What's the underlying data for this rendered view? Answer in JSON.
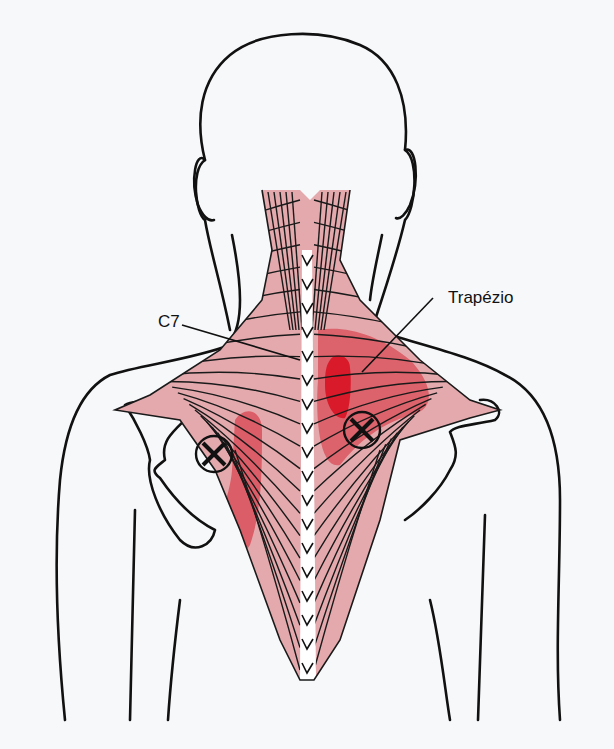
{
  "figure": {
    "labels": {
      "c7": "C7",
      "trapezius": "Trapézio"
    },
    "colors": {
      "background": "#f7f8fa",
      "muscle": "#e3a9ad",
      "muscle_dark": "#d88890",
      "referred_pain": "#d9505a",
      "referred_pain_intense": "#d81a2a",
      "outline": "#111111"
    },
    "trigger_points": [
      {
        "name": "left-trigger-point",
        "side": "left",
        "marker": "circled-x"
      },
      {
        "name": "right-trigger-point",
        "side": "right",
        "marker": "circled-x"
      }
    ]
  }
}
